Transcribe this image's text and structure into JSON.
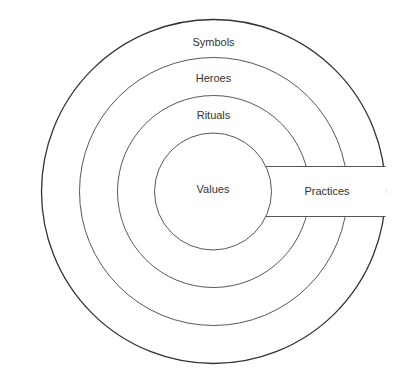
{
  "diagram": {
    "type": "concentric-circles",
    "layers": [
      {
        "name": "symbols",
        "label": "Symbols"
      },
      {
        "name": "heroes",
        "label": "Heroes"
      },
      {
        "name": "rituals",
        "label": "Rituals"
      },
      {
        "name": "values",
        "label": "Values"
      }
    ],
    "practices_label": "Practices",
    "colors": {
      "stroke": "#333333",
      "background": "#ffffff"
    }
  }
}
